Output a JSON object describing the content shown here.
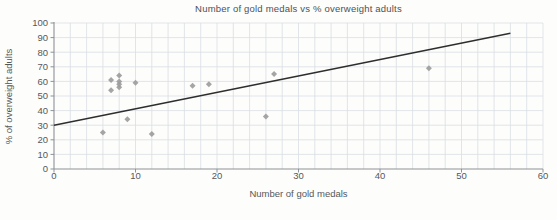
{
  "figure": {
    "title": "Number of gold medals vs % overweight adults",
    "xlabel": "Number of gold medals",
    "ylabel": "% of overweight adults"
  },
  "chart_data": {
    "type": "scatter",
    "title": "Number of gold medals vs % overweight adults",
    "xlabel": "Number of gold medals",
    "ylabel": "% of overweight adults",
    "xlim": [
      0,
      60
    ],
    "ylim": [
      0,
      100
    ],
    "x_ticks": [
      0,
      10,
      20,
      30,
      40,
      50,
      60
    ],
    "y_ticks": [
      0,
      10,
      20,
      30,
      40,
      50,
      60,
      70,
      80,
      90,
      100
    ],
    "x_minor_grid_step": 2,
    "y_grid_step": 10,
    "grid": true,
    "legend": null,
    "points": [
      [
        6,
        25
      ],
      [
        7,
        61
      ],
      [
        7,
        54
      ],
      [
        8,
        64
      ],
      [
        8,
        60
      ],
      [
        8,
        58
      ],
      [
        8,
        56
      ],
      [
        9,
        34
      ],
      [
        10,
        59
      ],
      [
        12,
        24
      ],
      [
        17,
        57
      ],
      [
        19,
        58
      ],
      [
        26,
        36
      ],
      [
        27,
        65
      ],
      [
        46,
        69
      ]
    ],
    "trend_line": {
      "x1": 0,
      "y1": 30,
      "x2": 56,
      "y2": 93
    },
    "marker": {
      "shape": "diamond",
      "color": "#9b9b9b",
      "size": 3
    },
    "colors": {
      "grid": "#d9dee3",
      "axis": "#8d9296",
      "tick_text": "#55585c",
      "trend_line": "#2e2e2e",
      "background": "#fdfdfc"
    }
  }
}
